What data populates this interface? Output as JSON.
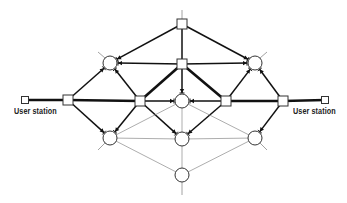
{
  "diagram": {
    "type": "network-topology",
    "colors": {
      "line": "#111111",
      "thin_line": "#8a8a8a",
      "node_fill": "#ffffff",
      "node_stroke": "#333333",
      "background": "#ffffff"
    },
    "labels": [
      {
        "id": "user-station-left",
        "text": "User station",
        "x": 14,
        "y": 106
      },
      {
        "id": "user-station-right",
        "text": "User station",
        "x": 293,
        "y": 106
      }
    ],
    "nodes": [
      {
        "id": "us_l",
        "shape": "square",
        "x": 25,
        "y": 100,
        "size": 7,
        "role": "user-station"
      },
      {
        "id": "us_r",
        "shape": "square",
        "x": 325,
        "y": 100,
        "size": 7,
        "role": "user-station"
      },
      {
        "id": "top",
        "shape": "square",
        "x": 182,
        "y": 24,
        "size": 10
      },
      {
        "id": "cu",
        "shape": "square",
        "x": 182,
        "y": 64,
        "size": 10
      },
      {
        "id": "ml1",
        "shape": "square",
        "x": 68,
        "y": 100,
        "size": 10
      },
      {
        "id": "ml2",
        "shape": "square",
        "x": 140,
        "y": 101,
        "size": 10
      },
      {
        "id": "mr2",
        "shape": "square",
        "x": 226,
        "y": 101,
        "size": 10
      },
      {
        "id": "mr1",
        "shape": "square",
        "x": 283,
        "y": 101,
        "size": 10
      },
      {
        "id": "cl",
        "shape": "circle",
        "x": 110,
        "y": 63,
        "r": 7
      },
      {
        "id": "cr",
        "shape": "circle",
        "x": 255,
        "y": 63,
        "r": 7
      },
      {
        "id": "cm",
        "shape": "circle",
        "x": 182,
        "y": 101,
        "r": 7
      },
      {
        "id": "ll",
        "shape": "circle",
        "x": 110,
        "y": 138,
        "r": 7
      },
      {
        "id": "lm",
        "shape": "circle",
        "x": 182,
        "y": 139,
        "r": 7
      },
      {
        "id": "lr",
        "shape": "circle",
        "x": 255,
        "y": 138,
        "r": 7
      },
      {
        "id": "bot",
        "shape": "circle",
        "x": 182,
        "y": 175,
        "r": 7
      }
    ],
    "edges": [
      {
        "from": "us_l",
        "to": "ml1",
        "weight": "heavy"
      },
      {
        "from": "ml1",
        "to": "ml2",
        "weight": "heavy"
      },
      {
        "from": "mr2",
        "to": "mr1",
        "weight": "heavy"
      },
      {
        "from": "mr1",
        "to": "us_r",
        "weight": "heavy"
      },
      {
        "from": "ml2",
        "to": "cu",
        "weight": "heavy"
      },
      {
        "from": "cu",
        "to": "mr2",
        "weight": "heavy"
      },
      {
        "from": "top",
        "to": "cu",
        "weight": "medium"
      },
      {
        "from": "top",
        "to": "cl",
        "weight": "medium",
        "arrow": true
      },
      {
        "from": "top",
        "to": "cr",
        "weight": "medium",
        "arrow": true
      },
      {
        "from": "cu",
        "to": "cl",
        "weight": "medium",
        "arrow": true
      },
      {
        "from": "cu",
        "to": "cr",
        "weight": "medium",
        "arrow": true
      },
      {
        "from": "cu",
        "to": "cm",
        "weight": "medium",
        "arrow": true
      },
      {
        "from": "ml1",
        "to": "cl",
        "weight": "medium",
        "arrow": true
      },
      {
        "from": "ml2",
        "to": "cl",
        "weight": "medium",
        "arrow": true
      },
      {
        "from": "mr2",
        "to": "cr",
        "weight": "medium",
        "arrow": true
      },
      {
        "from": "mr1",
        "to": "cr",
        "weight": "medium",
        "arrow": true
      },
      {
        "from": "ml2",
        "to": "cm",
        "weight": "medium",
        "arrow": true
      },
      {
        "from": "mr2",
        "to": "cm",
        "weight": "medium",
        "arrow": true
      },
      {
        "from": "ml1",
        "to": "ll",
        "weight": "medium",
        "arrow": true
      },
      {
        "from": "ml2",
        "to": "ll",
        "weight": "medium",
        "arrow": true
      },
      {
        "from": "ml2",
        "to": "lm",
        "weight": "medium",
        "arrow": true
      },
      {
        "from": "mr2",
        "to": "lm",
        "weight": "medium",
        "arrow": true
      },
      {
        "from": "mr1",
        "to": "lr",
        "weight": "medium",
        "arrow": true
      },
      {
        "from": "cm",
        "to": "ll",
        "weight": "thin"
      },
      {
        "from": "cm",
        "to": "lr",
        "weight": "thin"
      },
      {
        "from": "cm",
        "to": "lm",
        "weight": "thin"
      },
      {
        "from": "ll",
        "to": "lm",
        "weight": "thin"
      },
      {
        "from": "lm",
        "to": "lr",
        "weight": "thin"
      },
      {
        "from": "ll",
        "to": "bot",
        "weight": "thin"
      },
      {
        "from": "lr",
        "to": "bot",
        "weight": "thin"
      },
      {
        "from": "lm",
        "to": "bot",
        "weight": "thin"
      }
    ],
    "stubs": [
      {
        "x1": 182,
        "y1": 19,
        "x2": 182,
        "y2": 10
      },
      {
        "x1": 182,
        "y1": 182,
        "x2": 182,
        "y2": 195
      },
      {
        "x1": 105,
        "y1": 58,
        "x2": 98,
        "y2": 52
      },
      {
        "x1": 260,
        "y1": 58,
        "x2": 267,
        "y2": 52
      },
      {
        "x1": 105,
        "y1": 143,
        "x2": 98,
        "y2": 150
      },
      {
        "x1": 260,
        "y1": 143,
        "x2": 267,
        "y2": 150
      }
    ]
  }
}
